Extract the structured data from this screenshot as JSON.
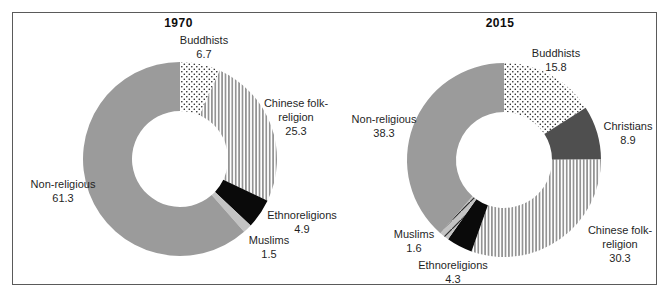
{
  "colors": {
    "background": "#ffffff",
    "border": "#5a5a5a",
    "mid_gray": "#9b9b9b",
    "dark_gray": "#4f4f4f",
    "black": "#0a0a0a",
    "light_gray": "#c3c3c3",
    "dot_ink": "#1a1a1a",
    "line_ink": "#4a4a4a",
    "diag_ink": "#2a2a2a"
  },
  "chart_data": [
    {
      "type": "pie",
      "donut": true,
      "title": "1970",
      "legend": "none",
      "labels_show_values": true,
      "layout": {
        "cx": 167,
        "cy": 146,
        "r_outer": 97,
        "r_inner": 48,
        "start_angle_deg": 0,
        "direction": "clockwise"
      },
      "slices": [
        {
          "label": "Buddhists",
          "value": 6.7,
          "fill": "dots",
          "label_lines": [
            "Buddhists",
            "6.7"
          ],
          "label_pos": {
            "x": 191,
            "y": 34
          }
        },
        {
          "label": "Chinese folk-religion",
          "value": 25.3,
          "fill": "vlines",
          "label_lines": [
            "Chinese folk-",
            "religion",
            "25.3"
          ],
          "label_pos": {
            "x": 283,
            "y": 104
          }
        },
        {
          "label": "Ethnoreligions",
          "value": 4.9,
          "fill": "solid_black",
          "label_lines": [
            "Ethnoreligions",
            "4.9"
          ],
          "label_pos": {
            "x": 289,
            "y": 209
          }
        },
        {
          "label": "Muslims",
          "value": 1.5,
          "fill": "light_gray",
          "label_lines": [
            "Muslims",
            "1.5"
          ],
          "label_pos": {
            "x": 256,
            "y": 234
          }
        },
        {
          "label": "Non-religious",
          "value": 61.3,
          "fill": "mid_gray",
          "label_lines": [
            "Non-religious",
            "61.3"
          ],
          "label_pos": {
            "x": 50,
            "y": 178
          }
        }
      ]
    },
    {
      "type": "pie",
      "donut": true,
      "title": "2015",
      "legend": "none",
      "labels_show_values": true,
      "layout": {
        "cx": 160,
        "cy": 147,
        "r_outer": 97,
        "r_inner": 48,
        "start_angle_deg": 0,
        "direction": "clockwise"
      },
      "slices": [
        {
          "label": "Buddhists",
          "value": 15.8,
          "fill": "dots",
          "label_lines": [
            "Buddhists",
            "15.8"
          ],
          "label_pos": {
            "x": 212,
            "y": 47
          }
        },
        {
          "label": "Christians",
          "value": 8.9,
          "fill": "dark_gray",
          "label_lines": [
            "Christians",
            "8.9"
          ],
          "label_pos": {
            "x": 284,
            "y": 120
          }
        },
        {
          "label": "Chinese folk-religion",
          "value": 30.3,
          "fill": "vlines",
          "label_lines": [
            "Chinese folk-",
            "religion",
            "30.3"
          ],
          "label_pos": {
            "x": 276,
            "y": 231
          }
        },
        {
          "label": "Ethnoreligions",
          "value": 4.3,
          "fill": "solid_black",
          "label_lines": [
            "Ethnoreligions",
            "4.3"
          ],
          "label_pos": {
            "x": 109,
            "y": 259
          }
        },
        {
          "label": "Muslims",
          "value": 1.6,
          "fill": "light_gray_diag",
          "label_lines": [
            "Muslims",
            "1.6"
          ],
          "label_pos": {
            "x": 70,
            "y": 228
          }
        },
        {
          "label": "Non-religious",
          "value": 38.3,
          "fill": "mid_gray",
          "label_lines": [
            "Non-religious",
            "38.3"
          ],
          "label_pos": {
            "x": 40,
            "y": 113
          }
        }
      ]
    }
  ]
}
